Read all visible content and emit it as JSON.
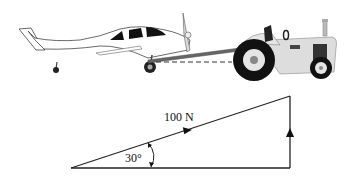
{
  "figure": {
    "illustration": {
      "objects": [
        "light aircraft",
        "tow bar",
        "tractor"
      ],
      "tow_line_style": "dashed horizontal reference"
    },
    "vector_diagram": {
      "force_label": "100 N",
      "angle_label": "30°",
      "colors": {
        "line": "#222222",
        "fill_dark": "#111111"
      }
    }
  }
}
